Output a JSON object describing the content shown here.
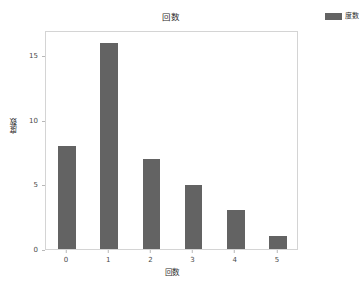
{
  "chart_data": {
    "type": "bar",
    "title": "回数",
    "xlabel": "回数",
    "ylabel": "度数",
    "categories": [
      "0",
      "1",
      "2",
      "3",
      "4",
      "5"
    ],
    "values": [
      8,
      16,
      7,
      5,
      3,
      1
    ],
    "series": [
      {
        "name": "度数",
        "values": [
          8,
          16,
          7,
          5,
          3,
          1
        ]
      }
    ],
    "yticks": [
      "0",
      "5",
      "10",
      "15"
    ],
    "ytick_values": [
      0,
      5,
      10,
      15
    ],
    "ylim": [
      0,
      17
    ],
    "xticks": [
      "0",
      "1",
      "2",
      "3",
      "4",
      "5"
    ],
    "grid": false,
    "legend": {
      "position": "top-right-outside",
      "entries": [
        {
          "label": "度数",
          "color": "#636363"
        }
      ]
    },
    "colors": {
      "bar": "#636363",
      "plot_border": "#d4d4d4",
      "background": "#ffffff",
      "tick_label": "#4a4a4a",
      "axis_label": "#2b2b2b"
    }
  }
}
